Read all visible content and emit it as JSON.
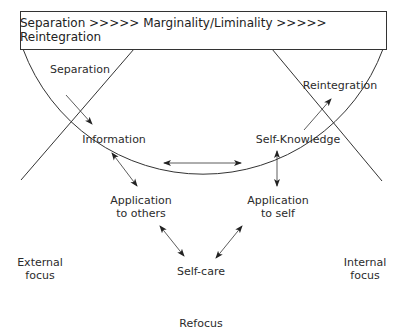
{
  "header": {
    "text": "Separation >>>>> Marginality/Liminality >>>>> Reintegration"
  },
  "nodes": {
    "separation": "Separation",
    "reintegration": "Reintegration",
    "information": "Information",
    "self_knowledge": "Self-Knowledge",
    "application_to_others_1": "Application",
    "application_to_others_2": "to others",
    "application_to_self_1": "Application",
    "application_to_self_2": "to self",
    "self_care": "Self-care"
  },
  "side_labels": {
    "external_1": "External",
    "external_2": "focus",
    "internal_1": "Internal",
    "internal_2": "focus",
    "refocus": "Refocus"
  },
  "colors": {
    "line": "#333333",
    "text": "#2b2b2b",
    "background": "#ffffff"
  }
}
